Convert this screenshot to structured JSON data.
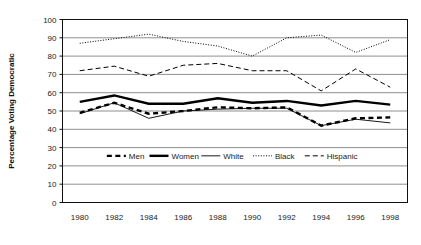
{
  "chart_data": {
    "type": "line",
    "title": "",
    "xlabel": "",
    "ylabel": "Percentage Voting Democratic",
    "x": [
      1980,
      1982,
      1984,
      1986,
      1988,
      1990,
      1992,
      1994,
      1996,
      1998
    ],
    "categories": [
      "1980",
      "1982",
      "1984",
      "1986",
      "1988",
      "1990",
      "1992",
      "1994",
      "1996",
      "1998"
    ],
    "xlim": [
      1979,
      1999
    ],
    "ylim": [
      0,
      100
    ],
    "ytick_values": [
      0,
      10,
      20,
      30,
      40,
      50,
      60,
      70,
      80,
      90,
      100
    ],
    "ytick_labels": [
      "0",
      "10",
      "20",
      "30",
      "40",
      "50",
      "60",
      "70",
      "80",
      "90",
      "100"
    ],
    "grid": "horizontal",
    "legend_position": "inside-lower-center",
    "series": [
      {
        "name": "Men",
        "style": "thick-dashed",
        "color": "#000000",
        "values": [
          49,
          54.5,
          48.5,
          50,
          52,
          51.5,
          52,
          42,
          46,
          46.5
        ]
      },
      {
        "name": "Women",
        "style": "thick-solid",
        "color": "#000000",
        "values": [
          55,
          58.5,
          54,
          54,
          57,
          54.5,
          55.5,
          53,
          55.5,
          53.5
        ]
      },
      {
        "name": "White",
        "style": "thin-solid",
        "color": "#000000",
        "values": [
          48.5,
          54.5,
          46,
          50,
          51,
          51.5,
          51.5,
          42,
          45.5,
          43.5
        ]
      },
      {
        "name": "Black",
        "style": "dotted",
        "color": "#000000",
        "values": [
          87,
          89.5,
          92,
          88,
          85.5,
          80,
          90,
          91.5,
          82,
          89
        ]
      },
      {
        "name": "Hispanic",
        "style": "dashed",
        "color": "#000000",
        "values": [
          72,
          74.5,
          69,
          75,
          76,
          72,
          72,
          61,
          73,
          63
        ]
      }
    ]
  },
  "legend": {
    "items": [
      {
        "label": "Men",
        "style": "thick-dashed"
      },
      {
        "label": "Women",
        "style": "thick-solid"
      },
      {
        "label": "White",
        "style": "thin-solid"
      },
      {
        "label": "Black",
        "style": "dotted"
      },
      {
        "label": "Hispanic",
        "style": "dashed"
      }
    ]
  }
}
